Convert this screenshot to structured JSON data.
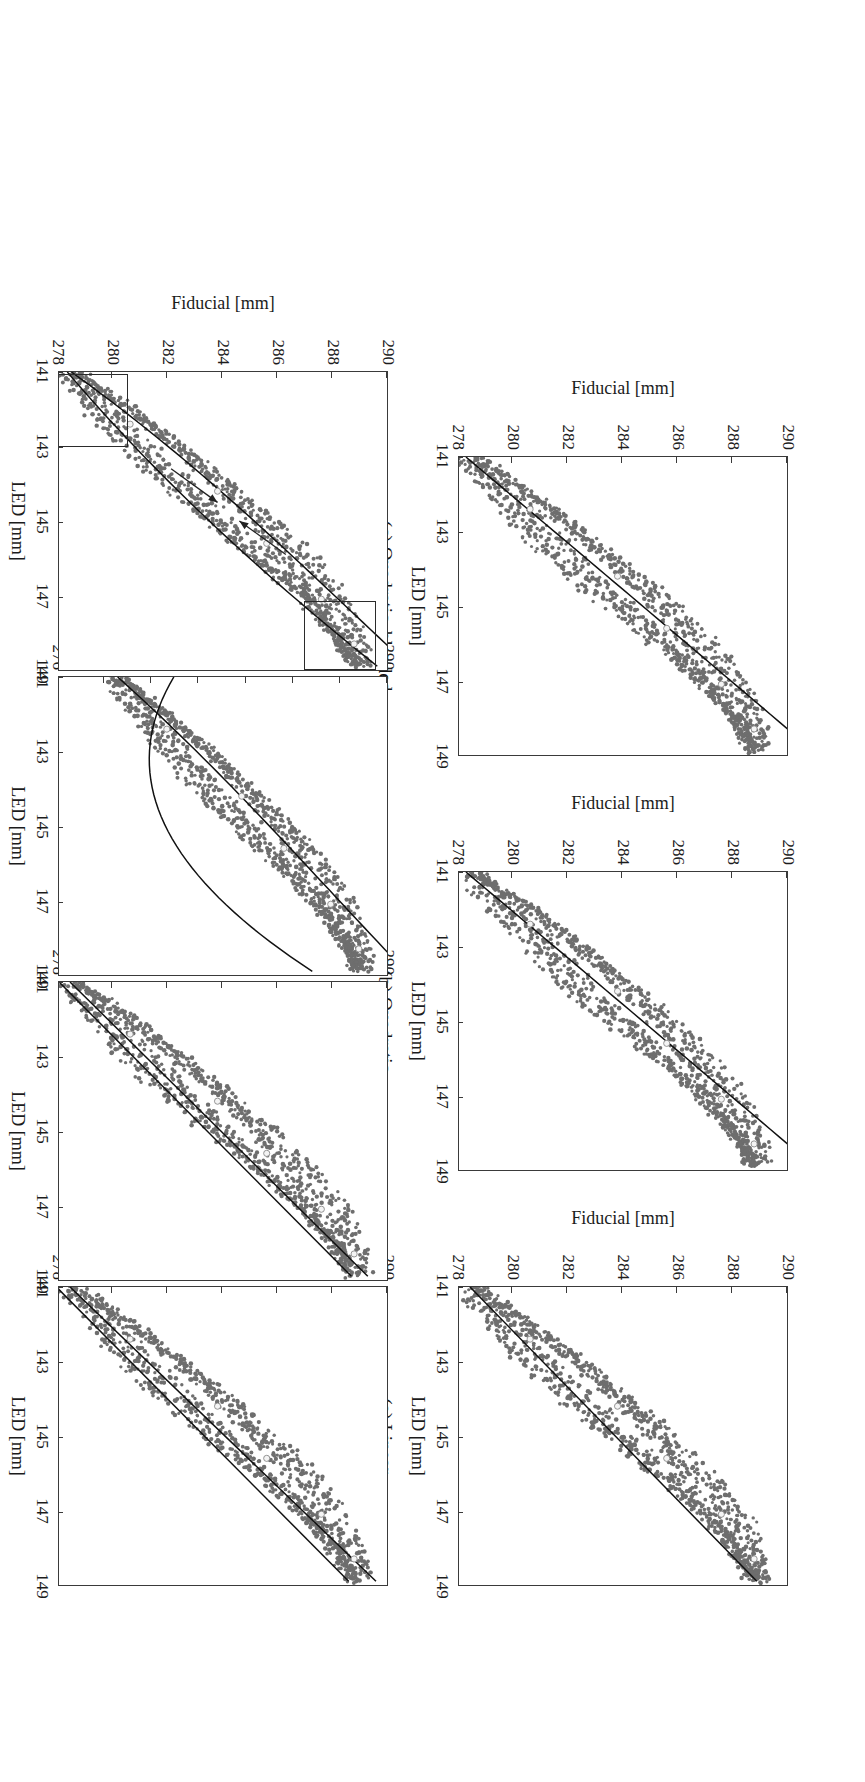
{
  "document": {
    "scan_header": "",
    "figure_kind": "multi-panel scatter plot with fitted curves",
    "rotation_degrees": 90
  },
  "axis_titles": {
    "x": "LED [mm]",
    "y": "Fiducial [mm]"
  },
  "chart_data": [
    {
      "id": "a",
      "type": "scatter",
      "title": "(a) Linear",
      "xlabel": "LED [mm]",
      "ylabel": "Fiducial [mm]",
      "xlim": [
        141,
        149
      ],
      "ylim": [
        278,
        290
      ],
      "xticks": [
        141,
        143,
        145,
        147,
        149
      ],
      "yticks": [
        278,
        280,
        282,
        284,
        286,
        288,
        290
      ],
      "grid": false,
      "legend": null,
      "series": [
        {
          "name": "measured hysteresis loop",
          "marker": "filled circle",
          "color": "#6e6e6e",
          "n_points": 900
        },
        {
          "name": "linear fit",
          "marker": "line",
          "color": "#111111",
          "model": "y = a + b*x"
        },
        {
          "name": "calibration nodes",
          "marker": "open circle",
          "color": "#f2f2f2"
        }
      ],
      "fit_endpoints": [
        [
          141,
          278.4
        ],
        [
          148.9,
          288.9
        ]
      ],
      "loop_upper_branch": [
        [
          141,
          278.6
        ],
        [
          142,
          280.6
        ],
        [
          143,
          282.4
        ],
        [
          144,
          284.0
        ],
        [
          145,
          285.5
        ],
        [
          146,
          286.8
        ],
        [
          147,
          287.8
        ],
        [
          148,
          288.5
        ],
        [
          148.9,
          289.0
        ]
      ],
      "loop_lower_branch": [
        [
          141,
          278.3
        ],
        [
          142,
          279.6
        ],
        [
          143,
          280.9
        ],
        [
          144,
          282.3
        ],
        [
          145,
          283.8
        ],
        [
          146,
          285.4
        ],
        [
          147,
          286.9
        ],
        [
          148,
          288.1
        ],
        [
          148.9,
          288.9
        ]
      ]
    },
    {
      "id": "b",
      "type": "scatter",
      "title": "(b) Quadratic",
      "xlabel": "LED [mm]",
      "ylabel": "Fiducial [mm]",
      "xlim": [
        141,
        149
      ],
      "ylim": [
        278,
        290
      ],
      "xticks": [
        141,
        143,
        145,
        147,
        149
      ],
      "yticks": [
        278,
        280,
        282,
        284,
        286,
        288,
        290
      ],
      "grid": false,
      "series": [
        {
          "name": "measured hysteresis loop",
          "marker": "filled circle",
          "color": "#6e6e6e",
          "n_points": 900
        },
        {
          "name": "quadratic fit",
          "marker": "line",
          "color": "#111111",
          "model": "y = a + b*x + c*x^2"
        },
        {
          "name": "calibration nodes",
          "marker": "open circle",
          "color": "#f2f2f2"
        }
      ],
      "fit_endpoints": [
        [
          141,
          278.2
        ],
        [
          148.9,
          288.9
        ]
      ],
      "loop_upper_branch": [
        [
          141,
          278.6
        ],
        [
          142,
          280.6
        ],
        [
          143,
          282.4
        ],
        [
          144,
          284.0
        ],
        [
          145,
          285.5
        ],
        [
          146,
          286.8
        ],
        [
          147,
          287.8
        ],
        [
          148,
          288.5
        ],
        [
          148.9,
          289.0
        ]
      ],
      "loop_lower_branch": [
        [
          141,
          278.3
        ],
        [
          142,
          279.6
        ],
        [
          143,
          280.9
        ],
        [
          144,
          282.3
        ],
        [
          145,
          283.8
        ],
        [
          146,
          285.4
        ],
        [
          147,
          286.9
        ],
        [
          148,
          288.1
        ],
        [
          148.9,
          288.9
        ]
      ]
    },
    {
      "id": "c",
      "type": "scatter",
      "title": "(c) Quadratic, blended",
      "xlabel": "LED [mm]",
      "ylabel": "Fiducial [mm]",
      "xlim": [
        141,
        149
      ],
      "ylim": [
        278,
        290
      ],
      "xticks": [
        141,
        143,
        145,
        147,
        149
      ],
      "yticks": [
        278,
        280,
        282,
        284,
        286,
        288,
        290
      ],
      "grid": false,
      "series": [
        {
          "name": "measured hysteresis loop",
          "marker": "filled circle",
          "color": "#6e6e6e",
          "n_points": 900
        },
        {
          "name": "blended quadratic fit",
          "marker": "line",
          "color": "#111111"
        },
        {
          "name": "calibration nodes",
          "marker": "open circle",
          "color": "#f2f2f2"
        }
      ],
      "fit_endpoints": [
        [
          141,
          278.2
        ],
        [
          148.9,
          288.9
        ]
      ],
      "loop_upper_branch": [
        [
          141,
          278.6
        ],
        [
          142,
          280.6
        ],
        [
          143,
          282.4
        ],
        [
          144,
          284.0
        ],
        [
          145,
          285.5
        ],
        [
          146,
          286.8
        ],
        [
          147,
          287.8
        ],
        [
          148,
          288.5
        ],
        [
          148.9,
          289.0
        ]
      ],
      "loop_lower_branch": [
        [
          141,
          278.3
        ],
        [
          142,
          279.6
        ],
        [
          143,
          280.9
        ],
        [
          144,
          282.3
        ],
        [
          145,
          283.8
        ],
        [
          146,
          285.4
        ],
        [
          147,
          286.9
        ],
        [
          148,
          288.1
        ],
        [
          148.9,
          288.9
        ]
      ]
    },
    {
      "id": "d",
      "type": "scatter",
      "title": "(d) Dual linear",
      "xlabel": "LED [mm]",
      "ylabel": "Fiducial [mm]",
      "xlim": [
        141,
        149
      ],
      "ylim": [
        278,
        290
      ],
      "xticks": [
        141,
        143,
        145,
        147,
        149
      ],
      "yticks": [
        278,
        280,
        282,
        284,
        286,
        288,
        290
      ],
      "grid": false,
      "series": [
        {
          "name": "measured hysteresis loop",
          "marker": "filled circle",
          "color": "#6e6e6e",
          "n_points": 900
        },
        {
          "name": "dual linear fit (ascending branch)",
          "marker": "line",
          "color": "#111111"
        },
        {
          "name": "dual linear fit (descending branch)",
          "marker": "line",
          "color": "#111111"
        },
        {
          "name": "calibration nodes",
          "marker": "open circle",
          "color": "#f2f2f2"
        }
      ],
      "fit_branch_upper": [
        [
          141,
          278.4
        ],
        [
          148.9,
          289.6
        ]
      ],
      "fit_branch_lower": [
        [
          141,
          277.9
        ],
        [
          148.9,
          288.6
        ]
      ],
      "loop_upper_branch": [
        [
          141,
          278.6
        ],
        [
          142,
          280.6
        ],
        [
          143,
          282.4
        ],
        [
          144,
          284.0
        ],
        [
          145,
          285.5
        ],
        [
          146,
          286.8
        ],
        [
          147,
          287.8
        ],
        [
          148,
          288.5
        ],
        [
          148.9,
          289.0
        ]
      ],
      "loop_lower_branch": [
        [
          141,
          278.3
        ],
        [
          142,
          279.6
        ],
        [
          143,
          280.9
        ],
        [
          144,
          282.3
        ],
        [
          145,
          283.8
        ],
        [
          146,
          285.4
        ],
        [
          147,
          286.9
        ],
        [
          148,
          288.1
        ],
        [
          148.9,
          288.9
        ]
      ]
    },
    {
      "id": "e",
      "type": "scatter",
      "title": "(e) Dual linear, blended",
      "xlabel": "LED [mm]",
      "ylabel": "Fiducial [mm]",
      "xlim": [
        141,
        149
      ],
      "ylim": [
        278,
        290
      ],
      "xticks": [
        141,
        143,
        145,
        147,
        149
      ],
      "yticks": [
        278,
        280,
        282,
        284,
        286,
        288,
        290
      ],
      "grid": false,
      "series": [
        {
          "name": "measured hysteresis loop",
          "marker": "filled circle",
          "color": "#6e6e6e",
          "n_points": 900
        },
        {
          "name": "blended dual linear fit (upper)",
          "marker": "line",
          "color": "#111111"
        },
        {
          "name": "blended dual linear fit (lower)",
          "marker": "line",
          "color": "#111111"
        },
        {
          "name": "calibration nodes",
          "marker": "open circle",
          "color": "#f2f2f2"
        }
      ],
      "fit_branch_upper": [
        [
          141,
          278.4
        ],
        [
          148.9,
          289.3
        ]
      ],
      "fit_branch_lower": [
        [
          141,
          278.0
        ],
        [
          148.9,
          288.7
        ]
      ],
      "loop_upper_branch": [
        [
          141,
          278.6
        ],
        [
          142,
          280.6
        ],
        [
          143,
          282.4
        ],
        [
          144,
          284.0
        ],
        [
          145,
          285.5
        ],
        [
          146,
          286.8
        ],
        [
          147,
          287.8
        ],
        [
          148,
          288.5
        ],
        [
          148.9,
          289.0
        ]
      ],
      "loop_lower_branch": [
        [
          141,
          278.3
        ],
        [
          142,
          279.6
        ],
        [
          143,
          280.9
        ],
        [
          144,
          282.3
        ],
        [
          145,
          283.8
        ],
        [
          146,
          285.4
        ],
        [
          147,
          286.9
        ],
        [
          148,
          288.1
        ],
        [
          148.9,
          288.9
        ]
      ]
    },
    {
      "id": "f",
      "type": "scatter",
      "title": "(f) Dual quadratic",
      "xlabel": "LED [mm]",
      "ylabel": "Fiducial [mm]",
      "xlim": [
        141,
        149
      ],
      "ylim": [
        276,
        290
      ],
      "xticks": [
        141,
        143,
        145,
        147,
        149
      ],
      "yticks": [
        276,
        278,
        280,
        282,
        284,
        286,
        288,
        290
      ],
      "grid": false,
      "series": [
        {
          "name": "measured hysteresis loop",
          "marker": "filled circle",
          "color": "#6e6e6e",
          "n_points": 900
        },
        {
          "name": "dual quadratic fit (upper branch)",
          "marker": "line",
          "color": "#111111"
        },
        {
          "name": "dual quadratic fit (lower branch, diverges below 280)",
          "marker": "line",
          "color": "#111111"
        },
        {
          "name": "calibration nodes",
          "marker": "open circle",
          "color": "#f2f2f2"
        }
      ],
      "loop_upper_branch": [
        [
          141,
          278.6
        ],
        [
          142,
          280.6
        ],
        [
          143,
          282.4
        ],
        [
          144,
          284.0
        ],
        [
          145,
          285.5
        ],
        [
          146,
          286.8
        ],
        [
          147,
          287.8
        ],
        [
          148,
          288.5
        ],
        [
          148.9,
          289.0
        ]
      ],
      "loop_lower_branch": [
        [
          141,
          278.3
        ],
        [
          142,
          279.6
        ],
        [
          143,
          280.9
        ],
        [
          144,
          282.3
        ],
        [
          145,
          283.8
        ],
        [
          146,
          285.4
        ],
        [
          147,
          286.9
        ],
        [
          148,
          288.1
        ],
        [
          148.9,
          288.9
        ]
      ],
      "note": "lower-branch quadratic overshoots downward near x = 142-143"
    },
    {
      "id": "g",
      "type": "scatter",
      "title": "(g) Dual quadratic, blended",
      "xlabel": "LED [mm]",
      "ylabel": "Fiducial [mm]",
      "xlim": [
        141,
        149
      ],
      "ylim": [
        278,
        290
      ],
      "xticks": [
        141,
        143,
        145,
        147,
        149
      ],
      "yticks": [
        278,
        280,
        282,
        284,
        286,
        288,
        290
      ],
      "grid": false,
      "series": [
        {
          "name": "measured hysteresis loop",
          "marker": "filled circle",
          "color": "#6e6e6e",
          "n_points": 900
        },
        {
          "name": "blended dual quadratic fit",
          "marker": "line",
          "color": "#111111"
        },
        {
          "name": "calibration nodes",
          "marker": "open circle",
          "color": "#f2f2f2"
        }
      ],
      "loop_upper_branch": [
        [
          141,
          278.6
        ],
        [
          142,
          280.6
        ],
        [
          143,
          282.4
        ],
        [
          144,
          284.0
        ],
        [
          145,
          285.5
        ],
        [
          146,
          286.8
        ],
        [
          147,
          287.8
        ],
        [
          148,
          288.5
        ],
        [
          148.9,
          289.0
        ]
      ],
      "loop_lower_branch": [
        [
          141,
          278.3
        ],
        [
          142,
          279.6
        ],
        [
          143,
          280.9
        ],
        [
          144,
          282.3
        ],
        [
          145,
          283.8
        ],
        [
          146,
          285.4
        ],
        [
          147,
          286.9
        ],
        [
          148,
          288.1
        ],
        [
          148.9,
          288.9
        ]
      ],
      "annotations": [
        {
          "kind": "highlight-box",
          "name": "blend-region-upper",
          "x_range": [
            147.1,
            148.95
          ],
          "y_range": [
            287.0,
            289.6
          ]
        },
        {
          "kind": "highlight-box",
          "name": "blend-region-lower",
          "x_range": [
            141.05,
            143.0
          ],
          "y_range": [
            278.0,
            280.6
          ]
        },
        {
          "kind": "arrow",
          "name": "descending-direction-arrow",
          "from": [
            145.9,
            286.3
          ],
          "to": [
            145.0,
            284.6
          ]
        },
        {
          "kind": "arrow",
          "name": "ascending-direction-arrow",
          "from": [
            143.6,
            282.1
          ],
          "to": [
            144.5,
            283.8
          ]
        }
      ]
    }
  ]
}
